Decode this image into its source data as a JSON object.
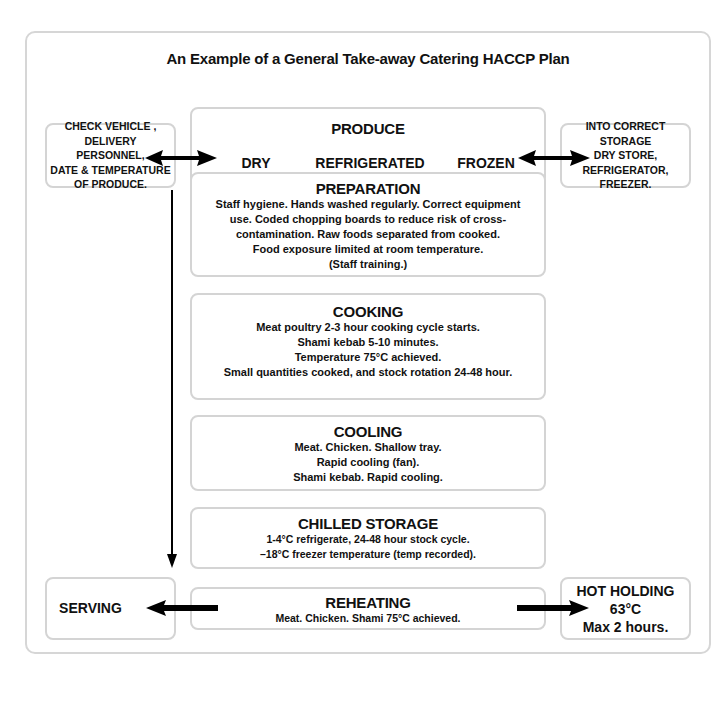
{
  "title": "An Example of a General Take-away Catering HACCP Plan",
  "left_top_box": {
    "lines": [
      "CHECK VEHICLE ,",
      "DELIVERY",
      "PERSONNEL,",
      "DATE & TEMPERATURE",
      "OF PRODUCE."
    ]
  },
  "right_top_box": {
    "lines": [
      "INTO CORRECT",
      "STORAGE",
      "DRY STORE,",
      "REFRIGERATOR,",
      "FREEZER."
    ]
  },
  "steps": {
    "produce": {
      "heading": "PRODUCE",
      "categories": [
        "DRY",
        "REFRIGERATED",
        "FROZEN"
      ]
    },
    "preparation": {
      "heading": "PREPARATION",
      "lines": [
        "Staff hygiene. Hands washed regularly. Correct equipment",
        "use. Coded chopping boards to reduce risk of cross-",
        "contamination. Raw foods separated from cooked.",
        "Food exposure limited at room temperature.",
        "(Staff training.)"
      ]
    },
    "cooking": {
      "heading": "COOKING",
      "lines": [
        "Meat poultry 2-3 hour cooking cycle starts.",
        "Shami kebab 5-10 minutes.",
        "Temperature 75°C achieved.",
        "Small quantities cooked, and stock rotation 24-48 hour."
      ]
    },
    "cooling": {
      "heading": "COOLING",
      "lines": [
        "Meat. Chicken. Shallow tray.",
        "Rapid cooling (fan).",
        "Shami kebab. Rapid cooling."
      ]
    },
    "chilled_storage": {
      "heading": "CHILLED STORAGE",
      "lines": [
        "1-4°C refrigerate, 24-48 hour stock cycle.",
        "–18°C freezer temperature (temp recorded)."
      ]
    },
    "reheating": {
      "heading": "REHEATING",
      "lines": [
        "Meat. Chicken. Shami 75°C achieved."
      ]
    }
  },
  "serving_box": {
    "label": "SERVING"
  },
  "hot_holding_box": {
    "lines": [
      "HOT HOLDING",
      "63°C",
      "Max 2 hours."
    ]
  },
  "colors": {
    "border": "#d4d4d4",
    "arrow": "#000000",
    "text": "#111111"
  }
}
